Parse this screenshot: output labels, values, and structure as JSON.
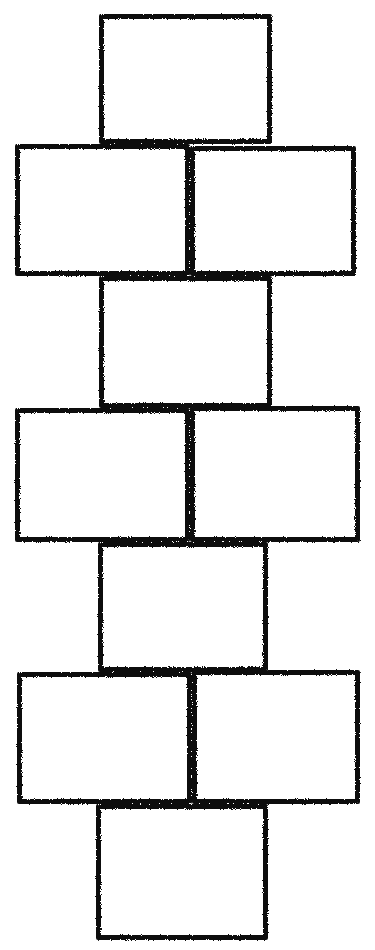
{
  "diagram": {
    "title": "",
    "kind": "hopscotch-grid",
    "stroke_color": "#111111",
    "background": "#ffffff",
    "squares": [
      {
        "id": "sq-1",
        "row": 1,
        "x": 99,
        "y": 14,
        "w": 173,
        "h": 130
      },
      {
        "id": "sq-2",
        "row": 2,
        "x": 15,
        "y": 144,
        "w": 175,
        "h": 132
      },
      {
        "id": "sq-3",
        "row": 2,
        "x": 190,
        "y": 146,
        "w": 166,
        "h": 130
      },
      {
        "id": "sq-4",
        "row": 3,
        "x": 99,
        "y": 276,
        "w": 173,
        "h": 132
      },
      {
        "id": "sq-5",
        "row": 4,
        "x": 15,
        "y": 408,
        "w": 175,
        "h": 134
      },
      {
        "id": "sq-6",
        "row": 4,
        "x": 190,
        "y": 406,
        "w": 170,
        "h": 136
      },
      {
        "id": "sq-7",
        "row": 5,
        "x": 98,
        "y": 542,
        "w": 170,
        "h": 130
      },
      {
        "id": "sq-8",
        "row": 6,
        "x": 17,
        "y": 672,
        "w": 175,
        "h": 132
      },
      {
        "id": "sq-9",
        "row": 6,
        "x": 192,
        "y": 670,
        "w": 168,
        "h": 134
      },
      {
        "id": "sq-10",
        "row": 7,
        "x": 96,
        "y": 804,
        "w": 172,
        "h": 136
      }
    ]
  }
}
